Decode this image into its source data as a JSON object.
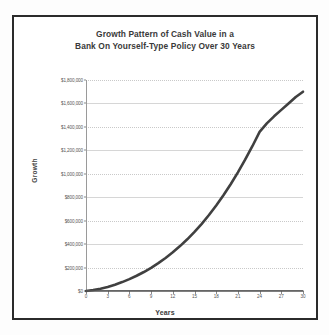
{
  "figure": {
    "border_color": "#2b2b2b",
    "background": "#ffffff"
  },
  "title": {
    "line1": "Growth Pattern of Cash Value in a",
    "line2": "Bank On Yourself-Type Policy Over 30 Years"
  },
  "axes": {
    "ylabel": "Growth",
    "xlabel": "Years"
  },
  "chart_data": {
    "type": "line",
    "title": "Growth Pattern of Cash Value in a Bank On Yourself-Type Policy Over 30 Years",
    "xlabel": "Years",
    "ylabel": "Growth",
    "xlim": [
      0,
      30
    ],
    "ylim": [
      0,
      1800000
    ],
    "grid": true,
    "legend": "none",
    "xticks": [
      0,
      3,
      6,
      9,
      12,
      15,
      18,
      21,
      24,
      27,
      30
    ],
    "xtick_labels": [
      "0",
      "3",
      "6",
      "9",
      "12",
      "15",
      "18",
      "21",
      "24",
      "27",
      "30"
    ],
    "yticks": [
      0,
      200000,
      400000,
      600000,
      800000,
      1000000,
      1200000,
      1400000,
      1600000,
      1800000
    ],
    "ytick_labels": [
      "$0",
      "$200,000",
      "$400,000",
      "$600,000",
      "$800,000",
      "$1,000,000",
      "$1,200,000",
      "$1,400,000",
      "$1,600,000",
      "$1,800,000"
    ],
    "line_color": "#404040",
    "line_width": 2.6,
    "series": [
      {
        "name": "Cash Value Growth",
        "color": "#404040",
        "x": [
          0,
          1,
          2,
          3,
          4,
          5,
          6,
          7,
          8,
          9,
          10,
          11,
          12,
          13,
          14,
          15,
          16,
          17,
          18,
          19,
          20,
          21,
          22,
          23,
          24,
          25,
          26,
          27,
          28,
          29,
          30
        ],
        "values": [
          0,
          8000,
          20000,
          35000,
          54000,
          76000,
          101000,
          130000,
          162000,
          198000,
          238000,
          282000,
          330000,
          383000,
          441000,
          504000,
          573000,
          648000,
          729000,
          817000,
          911000,
          1012000,
          1120000,
          1235000,
          1357000,
          1430000,
          1490000,
          1545000,
          1600000,
          1655000,
          1700000
        ]
      },
      {
        "name": "Baseline",
        "color": "#555555",
        "x": [
          0,
          30
        ],
        "values": [
          0,
          0
        ]
      }
    ]
  }
}
